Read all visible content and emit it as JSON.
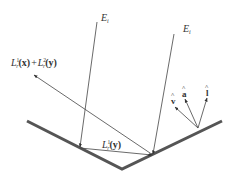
{
  "diagram": {
    "title": "",
    "labels": {
      "incident_left": "E",
      "incident_left_sub": "i",
      "incident_right": "E",
      "incident_right_sub": "i",
      "reflected_sum_part1": "L",
      "reflected_sum_sup1": "1",
      "reflected_sum_sub1": "r",
      "reflected_sum_arg1": "(x)",
      "reflected_sum_plus": "+",
      "reflected_sum_part2": "L",
      "reflected_sum_sup2": "2",
      "reflected_sum_sub2": "r",
      "reflected_sum_arg2": "(y)",
      "interreflection": "L",
      "interreflection_sup": "1",
      "interreflection_sub": "r",
      "interreflection_arg": "(y)",
      "vector_v": "v",
      "vector_a": "a",
      "vector_l": "l",
      "hat": "^"
    },
    "colors": {
      "surface": "#555555",
      "rays": "#444444",
      "text": "#333333"
    }
  }
}
